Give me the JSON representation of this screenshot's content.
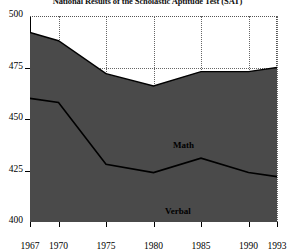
{
  "chart_data": {
    "type": "area",
    "title": "National Results of the Scholastic Aptitude Test (SAT)",
    "xlabel": "",
    "ylabel": "",
    "x": [
      1967,
      1970,
      1975,
      1980,
      1985,
      1990,
      1993
    ],
    "xlim": [
      1967,
      1993
    ],
    "ylim": [
      400,
      500
    ],
    "xticks": [
      1967,
      1970,
      1975,
      1980,
      1985,
      1990,
      1993
    ],
    "yticks": [
      400,
      425,
      450,
      475,
      500
    ],
    "xtick_labels": [
      "1967",
      "1970",
      "1975",
      "1980",
      "1985",
      "1990",
      "1993"
    ],
    "ytick_labels": [
      "400",
      "425",
      "450",
      "475",
      "500"
    ],
    "grid": true,
    "legend": "inline-labels",
    "fill_color": "#4a4a4a",
    "line_color": "#000000",
    "series": [
      {
        "name": "Math",
        "label": "Math",
        "values": [
          492,
          488,
          472,
          466,
          473,
          473,
          475
        ]
      },
      {
        "name": "Verbal",
        "label": "Verbal",
        "values": [
          460,
          458,
          428,
          424,
          431,
          424,
          422
        ]
      }
    ]
  },
  "axes": {
    "y_labels": [
      "500",
      "475",
      "450",
      "425",
      "400"
    ],
    "x_labels": [
      "1967",
      "1970",
      "1975",
      "1980",
      "1985",
      "1990",
      "1993"
    ]
  },
  "labels": {
    "math": "Math",
    "verbal": "Verbal"
  },
  "title": "National Results of the Scholastic Aptitude Test (SAT)"
}
